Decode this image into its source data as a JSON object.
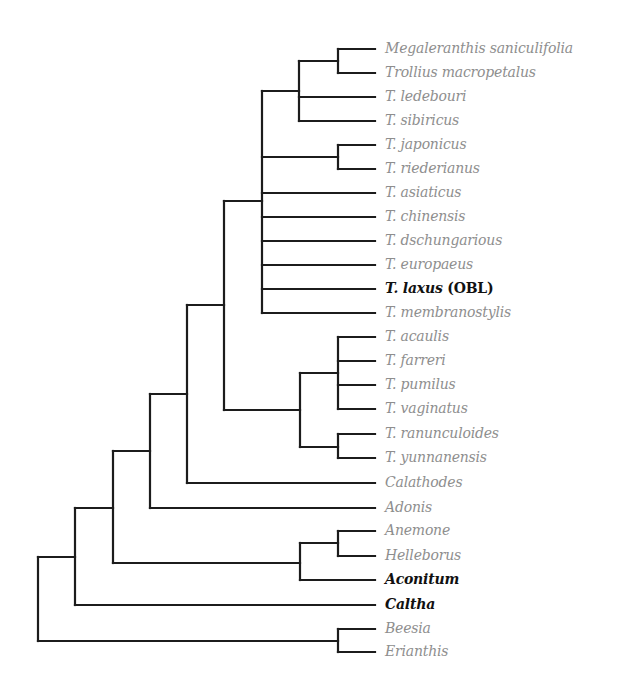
{
  "figure": {
    "type": "phylogenetic-tree",
    "leaf_line_end_x": 375,
    "label_x": 385,
    "colors": {
      "branch": "#1c1c1c",
      "label_default": "#8e8e8e",
      "label_highlight": "#111111"
    }
  },
  "leaves": [
    {
      "id": "L0",
      "label": "Megaleranthis saniculifolia",
      "suffix": "",
      "y": 49,
      "bold": false
    },
    {
      "id": "L1",
      "label": "Trollius macropetalus",
      "suffix": "",
      "y": 73,
      "bold": false
    },
    {
      "id": "L2",
      "label": "T. ledebouri",
      "suffix": "",
      "y": 97,
      "bold": false
    },
    {
      "id": "L3",
      "label": "T. sibiricus",
      "suffix": "",
      "y": 121,
      "bold": false
    },
    {
      "id": "L4",
      "label": "T. japonicus",
      "suffix": "",
      "y": 145,
      "bold": false
    },
    {
      "id": "L5",
      "label": "T. riederianus",
      "suffix": "",
      "y": 169,
      "bold": false
    },
    {
      "id": "L6",
      "label": "T. asiaticus",
      "suffix": "",
      "y": 193,
      "bold": false
    },
    {
      "id": "L7",
      "label": "T. chinensis",
      "suffix": "",
      "y": 217,
      "bold": false
    },
    {
      "id": "L8",
      "label": "T. dschungarious",
      "suffix": "",
      "y": 241,
      "bold": false
    },
    {
      "id": "L9",
      "label": "T. europaeus",
      "suffix": "",
      "y": 265,
      "bold": false
    },
    {
      "id": "L10",
      "label": "T. laxus",
      "suffix": " (OBL)",
      "y": 289,
      "bold": true
    },
    {
      "id": "L11",
      "label": "T. membranostylis",
      "suffix": "",
      "y": 313,
      "bold": false
    },
    {
      "id": "L12",
      "label": "T. acaulis",
      "suffix": "",
      "y": 337,
      "bold": false
    },
    {
      "id": "L13",
      "label": "T. farreri",
      "suffix": "",
      "y": 361,
      "bold": false
    },
    {
      "id": "L14",
      "label": "T. pumilus",
      "suffix": "",
      "y": 385,
      "bold": false
    },
    {
      "id": "L15",
      "label": "T. vaginatus",
      "suffix": "",
      "y": 409,
      "bold": false
    },
    {
      "id": "L16",
      "label": "T. ranunculoides",
      "suffix": "",
      "y": 434,
      "bold": false
    },
    {
      "id": "L17",
      "label": "T. yunnanensis",
      "suffix": "",
      "y": 458,
      "bold": false
    },
    {
      "id": "L18",
      "label": "Calathodes",
      "suffix": "",
      "y": 483,
      "bold": false
    },
    {
      "id": "L19",
      "label": "Adonis",
      "suffix": "",
      "y": 508,
      "bold": false
    },
    {
      "id": "L20",
      "label": "Anemone",
      "suffix": "",
      "y": 531,
      "bold": false
    },
    {
      "id": "L21",
      "label": "Helleborus",
      "suffix": "",
      "y": 556,
      "bold": false
    },
    {
      "id": "L22",
      "label": "Aconitum",
      "suffix": "",
      "y": 580,
      "bold": true
    },
    {
      "id": "L23",
      "label": "Caltha",
      "suffix": "",
      "y": 605,
      "bold": true
    },
    {
      "id": "L24",
      "label": "Beesia",
      "suffix": "",
      "y": 629,
      "bold": false
    },
    {
      "id": "L25",
      "label": "Erianthis",
      "suffix": "",
      "y": 652,
      "bold": false
    }
  ],
  "nodes": [
    {
      "id": "n_mega_troll",
      "x": 338,
      "children": [
        "L0",
        "L1"
      ]
    },
    {
      "id": "n_ledeb",
      "x": 299,
      "children": [
        "n_mega_troll",
        "L2",
        "L3"
      ]
    },
    {
      "id": "n_jap_ried",
      "x": 338,
      "children": [
        "L4",
        "L5"
      ]
    },
    {
      "id": "n_polytomy",
      "x": 262,
      "children": [
        "n_ledeb",
        "n_jap_ried",
        "L6",
        "L7",
        "L8",
        "L9",
        "L10",
        "L11"
      ]
    },
    {
      "id": "n_acaulis",
      "x": 338,
      "children": [
        "L12",
        "L13",
        "L14",
        "L15"
      ]
    },
    {
      "id": "n_ranun_yunn",
      "x": 338,
      "children": [
        "L16",
        "L17"
      ]
    },
    {
      "id": "n_sw_clade",
      "x": 300,
      "children": [
        "n_acaulis",
        "n_ranun_yunn"
      ]
    },
    {
      "id": "n_trollius",
      "x": 224,
      "children": [
        "n_polytomy",
        "n_sw_clade"
      ]
    },
    {
      "id": "n_calathodes",
      "x": 187,
      "children": [
        "n_trollius",
        "L18"
      ]
    },
    {
      "id": "n_adonis",
      "x": 150,
      "children": [
        "n_calathodes",
        "L19"
      ]
    },
    {
      "id": "n_anem_hell",
      "x": 338,
      "children": [
        "L20",
        "L21"
      ]
    },
    {
      "id": "n_aconitum",
      "x": 300,
      "children": [
        "n_anem_hell",
        "L22"
      ]
    },
    {
      "id": "n_113",
      "x": 113,
      "children": [
        "n_adonis",
        "n_aconitum"
      ]
    },
    {
      "id": "n_caltha",
      "x": 75,
      "children": [
        "n_113",
        "L23"
      ]
    },
    {
      "id": "n_bees_erian",
      "x": 338,
      "children": [
        "L24",
        "L25"
      ]
    },
    {
      "id": "root",
      "x": 38,
      "children": [
        "n_caltha",
        "n_bees_erian"
      ]
    }
  ],
  "node_y_overrides": {
    "n_ledeb": 91,
    "n_polytomy": 201,
    "n_sw_clade": 410,
    "n_trollius": 305,
    "n_calathodes": 394,
    "n_adonis": 451,
    "n_113": 508,
    "n_caltha": 557,
    "n_acaulis": 373,
    "n_ranun_yunn": 447,
    "n_mega_troll": 61,
    "n_jap_ried": 157,
    "n_anem_hell": 543,
    "n_aconitum": 563,
    "n_bees_erian": 641,
    "root": 599
  }
}
